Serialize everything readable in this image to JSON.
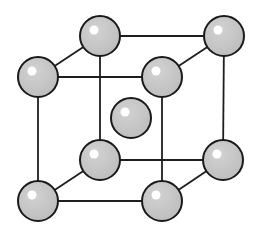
{
  "style": {
    "atom_color": "#c4c4c4",
    "outline_color": "#1a1a1a",
    "highlight_color": "#ffffff",
    "background": "#ffffff"
  },
  "atom_radius": 20,
  "atoms": [
    {
      "id": "back-top-left",
      "x": 100,
      "y": 36
    },
    {
      "id": "back-top-right",
      "x": 224,
      "y": 36
    },
    {
      "id": "front-top-left",
      "x": 38,
      "y": 77
    },
    {
      "id": "front-top-right",
      "x": 162,
      "y": 77
    },
    {
      "id": "center",
      "x": 131,
      "y": 118
    },
    {
      "id": "back-bottom-left",
      "x": 100,
      "y": 160
    },
    {
      "id": "back-bottom-right",
      "x": 223,
      "y": 160
    },
    {
      "id": "front-bottom-left",
      "x": 38,
      "y": 201
    },
    {
      "id": "front-bottom-right",
      "x": 162,
      "y": 201
    }
  ],
  "bonds": [
    [
      "back-top-left",
      "back-top-right"
    ],
    [
      "front-top-left",
      "front-top-right"
    ],
    [
      "back-top-left",
      "front-top-left"
    ],
    [
      "back-top-right",
      "front-top-right"
    ],
    [
      "back-bottom-left",
      "back-bottom-right"
    ],
    [
      "front-bottom-left",
      "front-bottom-right"
    ],
    [
      "back-bottom-left",
      "front-bottom-left"
    ],
    [
      "back-bottom-right",
      "front-bottom-right"
    ],
    [
      "back-top-left",
      "back-bottom-left"
    ],
    [
      "back-top-right",
      "back-bottom-right"
    ],
    [
      "front-top-left",
      "front-bottom-left"
    ],
    [
      "front-top-right",
      "front-bottom-right"
    ]
  ],
  "draw_order": [
    "back-top-left",
    "back-top-right",
    "back-bottom-left",
    "back-bottom-right",
    "center",
    "front-top-left",
    "front-top-right",
    "front-bottom-left",
    "front-bottom-right"
  ]
}
